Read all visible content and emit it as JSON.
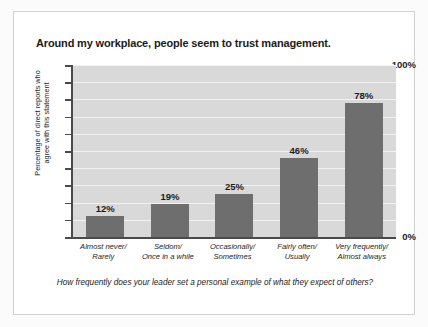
{
  "chart_data": {
    "type": "bar",
    "title": "Around my workplace, people seem to trust management.",
    "categories": [
      "Almost never/\nRarely",
      "Seldom/\nOnce in a while",
      "Occasionally/\nSometimes",
      "Fairly often/\nUsually",
      "Very frequently/\nAlmost always"
    ],
    "category_lines": [
      [
        "Almost never/",
        "Rarely"
      ],
      [
        "Seldom/",
        "Once in a while"
      ],
      [
        "Occasionally/",
        "Sometimes"
      ],
      [
        "Fairly often/",
        "Usually"
      ],
      [
        "Very frequently/",
        "Almost always"
      ]
    ],
    "values": [
      12,
      19,
      25,
      46,
      78
    ],
    "value_labels": [
      "12%",
      "19%",
      "25%",
      "46%",
      "78%"
    ],
    "ylabel": "Percentage of direct reports who agree with this statement",
    "ylabel_lines": [
      "Percentage of direct reports who",
      "agree with this statement"
    ],
    "xlabel": "",
    "ylim": [
      0,
      100
    ],
    "ytick_values": [
      0,
      10,
      20,
      30,
      40,
      50,
      60,
      70,
      80,
      90,
      100
    ],
    "ytick_labels_shown": [
      "0%",
      "100%"
    ],
    "ytick_label_min": "0%",
    "ytick_label_max": "100%",
    "grid": true,
    "grid_interval": 10,
    "legend": null,
    "legend_position": "none",
    "caption": "How frequently does your leader set a personal example of what they expect of others?",
    "colors": {
      "bar": "#6e6e6e",
      "plot_background": "#d9d9d9",
      "gridline": "#f2f2f2",
      "axis": "#4a4a4a",
      "text": "#1b1b1b",
      "card_background": "#ffffff",
      "card_border": "#d2d2d2",
      "page_background": "#fbfbfb"
    }
  }
}
